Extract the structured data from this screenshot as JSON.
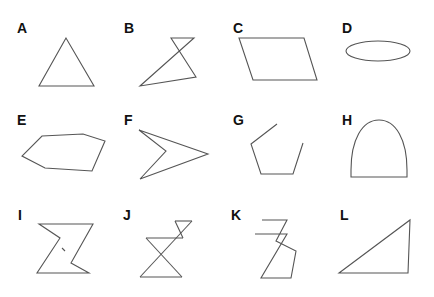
{
  "figure": {
    "background": "#ffffff",
    "stroke_color": "#555555",
    "panels": [
      {
        "label": "A",
        "shape": "equilateral triangle",
        "closed": true
      },
      {
        "label": "B",
        "shape": "self-intersecting quadrilateral",
        "closed": true
      },
      {
        "label": "C",
        "shape": "parallelogram",
        "closed": true
      },
      {
        "label": "D",
        "shape": "ellipse",
        "closed": true
      },
      {
        "label": "E",
        "shape": "irregular hexagon",
        "closed": true
      },
      {
        "label": "F",
        "shape": "concave arrowhead quadrilateral",
        "closed": true
      },
      {
        "label": "G",
        "shape": "open pentagon-like polyline",
        "closed": false
      },
      {
        "label": "H",
        "shape": "arch / semi-elliptical dome",
        "closed": true
      },
      {
        "label": "I",
        "shape": "hourglass / zigzag polygon with small mark",
        "closed": true
      },
      {
        "label": "J",
        "shape": "double bowtie crossing figure",
        "closed": false
      },
      {
        "label": "K",
        "shape": "open zigzag polyline",
        "closed": false
      },
      {
        "label": "L",
        "shape": "right triangle",
        "closed": true
      }
    ]
  }
}
